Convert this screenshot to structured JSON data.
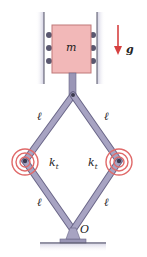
{
  "diagram": {
    "type": "mechanism",
    "labels": {
      "mass": "m",
      "gravity": "g",
      "link_length_upper_left": "ℓ",
      "link_length_upper_right": "ℓ",
      "link_length_lower_left": "ℓ",
      "link_length_lower_right": "ℓ",
      "spring_left": "k",
      "spring_left_sub": "t",
      "spring_right": "k",
      "spring_right_sub": "t",
      "pivot": "O"
    },
    "colors": {
      "mass_fill": "#f2b8b8",
      "spring": "#e06a6a",
      "link": "#8a86a8",
      "arrow": "#d64040",
      "wall": "#555566"
    }
  }
}
